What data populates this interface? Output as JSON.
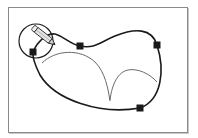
{
  "diagram": {
    "type": "bezier-path-editing-illustration",
    "colors": {
      "path": "#1a1a1a",
      "guide_curve": "#444444",
      "anchor_fill": "#1a1a1a",
      "frame_border": "#8a8a8a",
      "background": "#ffffff",
      "pencil_body": "#d8d8d8"
    },
    "anchors": [
      {
        "x": 33,
        "y": 52
      },
      {
        "x": 80,
        "y": 46
      },
      {
        "x": 157,
        "y": 45
      },
      {
        "x": 140,
        "y": 108
      }
    ],
    "tool": {
      "icon": "pencil-icon",
      "highlight": "selection-circle"
    },
    "guide_arcs": 2
  }
}
